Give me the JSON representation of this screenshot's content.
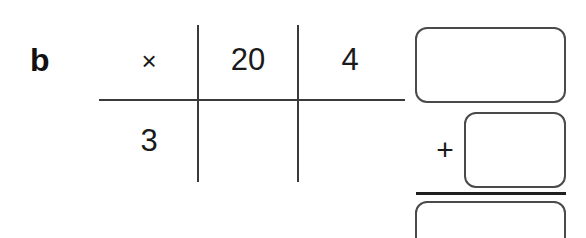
{
  "question": {
    "label": "b"
  },
  "grid": {
    "operator": "×",
    "column_headers": [
      "20",
      "4"
    ],
    "row_headers": [
      "3"
    ],
    "cells": [
      [
        "",
        ""
      ]
    ]
  },
  "sum": {
    "plus_label": "+",
    "partial_product_1": "",
    "partial_product_2": "",
    "total": ""
  },
  "colors": {
    "background": "#ffffff",
    "ink": "#1a1a1a",
    "grid_line": "#3a3a3a",
    "box_border": "#4a4a4a",
    "rule": "#1f1f1f"
  }
}
